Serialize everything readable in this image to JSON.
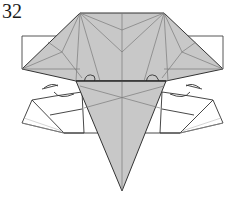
{
  "diagram": {
    "step_number": "32",
    "colors": {
      "paper_colored": "#c8c8c8",
      "paper_white": "#ffffff",
      "edge": "#333333",
      "crease": "#7a7a7a"
    }
  }
}
